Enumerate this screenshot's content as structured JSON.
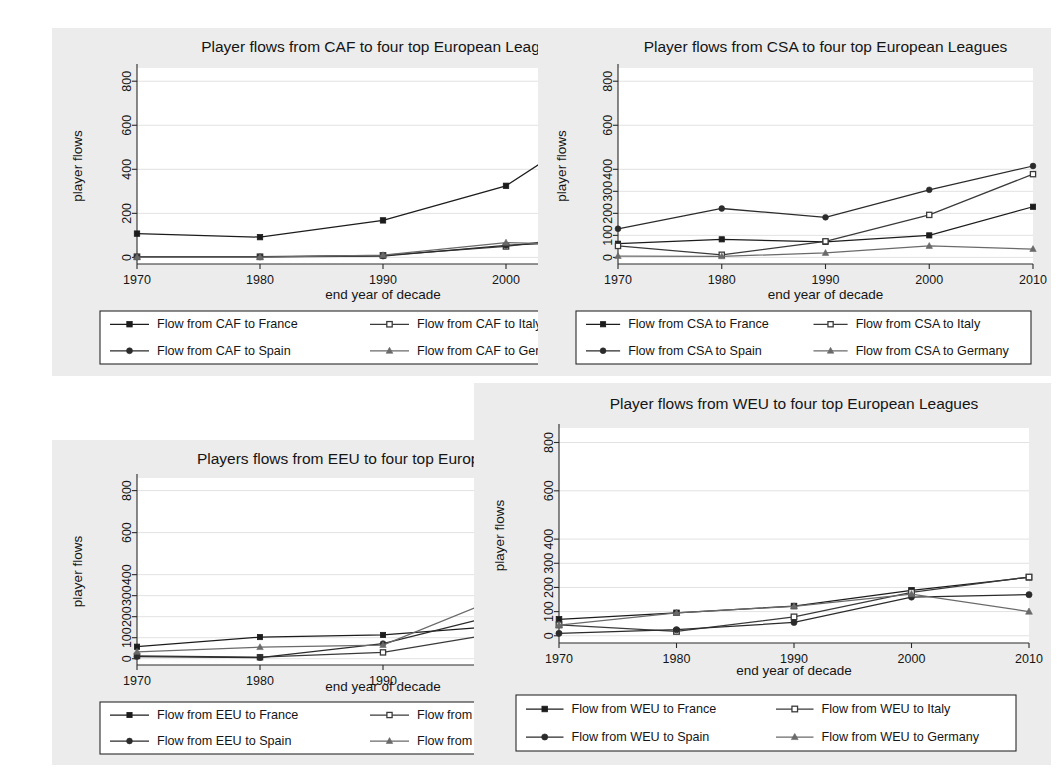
{
  "figure": {
    "background": "#ffffff",
    "panel_background": "#ececec",
    "plot_background": "#ffffff",
    "axis_color": "#2a2a2a",
    "grid_color": "#e2e2e2"
  },
  "common": {
    "xlabel": "end year of decade",
    "ylabel": "player flows",
    "xticks": [
      "1970",
      "1980",
      "1990",
      "2000",
      "2010"
    ]
  },
  "chart_data": [
    {
      "id": "caf",
      "type": "line",
      "title": "Player flows from CAF to four top European Leagues",
      "xlabel": "end year of decade",
      "ylabel": "player flows",
      "x": [
        1970,
        1980,
        1990,
        2000,
        2010
      ],
      "xtick_labels": [
        "1970",
        "1980",
        "1990",
        "2000",
        "2010"
      ],
      "ytick_labels": [
        "0",
        "200",
        "400",
        "600",
        "800"
      ],
      "ytick_values": [
        0,
        200,
        400,
        600,
        800
      ],
      "ylim": [
        -30,
        860
      ],
      "grid": true,
      "legend_position": "below",
      "series": [
        {
          "name": "Flow from CAF to France",
          "marker": "filled-square",
          "color": "#1c1c1c",
          "values": [
            108,
            92,
            168,
            325,
            688
          ]
        },
        {
          "name": "Flow from CAF to Italy",
          "marker": "open-square",
          "color": "#3a3a3a",
          "values": [
            3,
            3,
            9,
            50,
            118
          ]
        },
        {
          "name": "Flow from CAF to Spain",
          "marker": "filled-circle",
          "color": "#2b2b2b",
          "values": [
            2,
            2,
            6,
            55,
            80
          ]
        },
        {
          "name": "Flow from CAF to Germany",
          "marker": "filled-triangle",
          "color": "#6a6a6a",
          "values": [
            1,
            1,
            10,
            67,
            52
          ]
        }
      ]
    },
    {
      "id": "csa",
      "type": "line",
      "title": "Player flows from CSA to four top European Leagues",
      "xlabel": "end year of decade",
      "ylabel": "player flows",
      "x": [
        1970,
        1980,
        1990,
        2000,
        2010
      ],
      "xtick_labels": [
        "1970",
        "1980",
        "1990",
        "2000",
        "2010"
      ],
      "ytick_labels": [
        "0",
        "100",
        "200",
        "300",
        "400",
        "600",
        "800"
      ],
      "ytick_values": [
        0,
        100,
        200,
        300,
        400,
        600,
        800
      ],
      "ylim": [
        -30,
        860
      ],
      "grid": true,
      "legend_position": "below",
      "series": [
        {
          "name": "Flow from CSA to France",
          "marker": "filled-square",
          "color": "#1c1c1c",
          "values": [
            62,
            82,
            70,
            100,
            230
          ]
        },
        {
          "name": "Flow from CSA to Italy",
          "marker": "open-square",
          "color": "#3a3a3a",
          "values": [
            52,
            12,
            73,
            193,
            378
          ]
        },
        {
          "name": "Flow from CSA to Spain",
          "marker": "filled-circle",
          "color": "#2b2b2b",
          "values": [
            130,
            222,
            182,
            307,
            415
          ]
        },
        {
          "name": "Flow from CSA to Germany",
          "marker": "filled-triangle",
          "color": "#6a6a6a",
          "values": [
            6,
            5,
            20,
            52,
            38
          ]
        }
      ]
    },
    {
      "id": "eeu",
      "type": "line",
      "title": "Players flows from EEU to four top European Leagues",
      "xlabel": "end year of decade",
      "ylabel": "player flows",
      "x": [
        1970,
        1980,
        1990,
        2000,
        2010
      ],
      "xtick_labels": [
        "1970",
        "1980",
        "1990",
        "2000",
        "2010"
      ],
      "ytick_labels": [
        "0",
        "100",
        "200",
        "300",
        "400",
        "600",
        "800"
      ],
      "ytick_values": [
        0,
        100,
        200,
        300,
        400,
        600,
        800
      ],
      "ylim": [
        -30,
        860
      ],
      "grid": true,
      "legend_position": "below",
      "series": [
        {
          "name": "Flow from EEU to France",
          "marker": "filled-square",
          "color": "#1c1c1c",
          "values": [
            57,
            103,
            113,
            157,
            160
          ]
        },
        {
          "name": "Flow from EEU to Italy",
          "marker": "open-square",
          "color": "#3a3a3a",
          "values": [
            13,
            7,
            30,
            128,
            188
          ]
        },
        {
          "name": "Flow from EEU to Spain",
          "marker": "filled-circle",
          "color": "#2b2b2b",
          "values": [
            10,
            5,
            72,
            218,
            113
          ]
        },
        {
          "name": "Flow from EEU to Germany",
          "marker": "filled-triangle",
          "color": "#6a6a6a",
          "values": [
            33,
            55,
            65,
            302,
            172
          ]
        }
      ]
    },
    {
      "id": "weu",
      "type": "line",
      "title": "Player flows from WEU to four top European Leagues",
      "xlabel": "end year of decade",
      "ylabel": "player flows",
      "x": [
        1970,
        1980,
        1990,
        2000,
        2010
      ],
      "xtick_labels": [
        "1970",
        "1980",
        "1990",
        "2000",
        "2010"
      ],
      "ytick_labels": [
        "0",
        "100",
        "200",
        "300",
        "400",
        "600",
        "800"
      ],
      "ytick_values": [
        0,
        100,
        200,
        300,
        400,
        600,
        800
      ],
      "ylim": [
        -30,
        860
      ],
      "grid": true,
      "legend_position": "below",
      "series": [
        {
          "name": "Flow from WEU to France",
          "marker": "filled-square",
          "color": "#1c1c1c",
          "values": [
            68,
            95,
            123,
            188,
            242
          ]
        },
        {
          "name": "Flow from WEU to Italy",
          "marker": "open-square",
          "color": "#3a3a3a",
          "values": [
            45,
            18,
            78,
            180,
            243
          ]
        },
        {
          "name": "Flow from WEU to Spain",
          "marker": "filled-circle",
          "color": "#2b2b2b",
          "values": [
            10,
            25,
            55,
            160,
            170
          ]
        },
        {
          "name": "Flow from WEU to Germany",
          "marker": "filled-triangle",
          "color": "#6a6a6a",
          "values": [
            44,
            95,
            122,
            172,
            100
          ]
        }
      ]
    }
  ]
}
